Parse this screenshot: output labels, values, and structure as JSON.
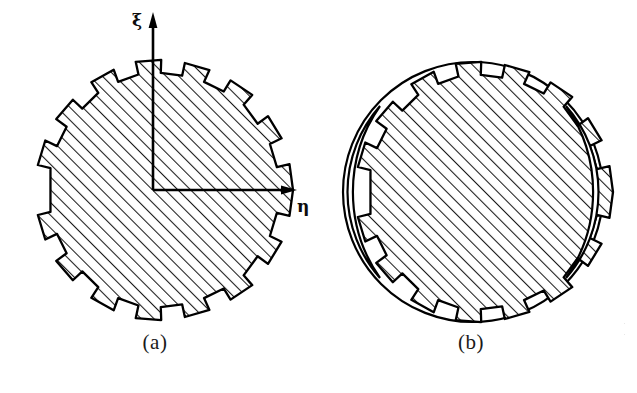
{
  "document": {
    "kind": "technical-line-drawing",
    "background_color": "#ffffff",
    "ink_color": "#000000",
    "description": "Two hatched gear-shaped cross-sections labelled (a) and (b)"
  },
  "figures": [
    {
      "id": "a",
      "caption": "(a)",
      "shape": "toothed-disk",
      "tooth_count": 16,
      "hatched": true,
      "hatch_angle_deg": 45,
      "has_axes": true,
      "lens_cutouts": 0
    },
    {
      "id": "b",
      "caption": "(b)",
      "shape": "toothed-disk",
      "tooth_count": 16,
      "hatched": true,
      "hatch_angle_deg": 45,
      "has_axes": false,
      "lens_cutouts": 2
    }
  ],
  "axes": {
    "vertical_label": "ξ",
    "horizontal_label": "η",
    "origin_x": 153,
    "origin_y": 190,
    "vertical_tip_y": 17,
    "horizontal_tip_x": 295
  },
  "colors": {
    "ink": "#000000",
    "paper": "#ffffff",
    "hatch": "#1a1a1a"
  },
  "edge_fragment": {
    "line1": "·",
    "line2": "·"
  }
}
